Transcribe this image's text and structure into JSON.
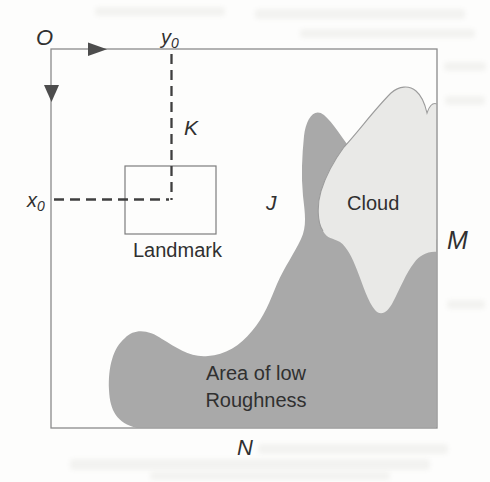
{
  "figure": {
    "origin": "O",
    "y_axis": {
      "base": "y",
      "sub": "0"
    },
    "x_axis": {
      "base": "x",
      "sub": "0"
    },
    "point_k": "K",
    "point_j": "J",
    "point_m": "M",
    "point_n": "N",
    "landmark_label": "Landmark",
    "cloud_label": "Cloud",
    "roughness_label_line1": "Area of low",
    "roughness_label_line2": "Roughness"
  },
  "colors": {
    "roughness_fill": "#a9a9a9",
    "cloud_fill": "#e9e9e7",
    "cloud_stroke": "#9c9c9c",
    "border": "#8b8b8b",
    "landmark_stroke": "#7d7d7d",
    "dash": "#3f3f3f",
    "arrow": "#4d4d4d",
    "text": "#303030"
  }
}
